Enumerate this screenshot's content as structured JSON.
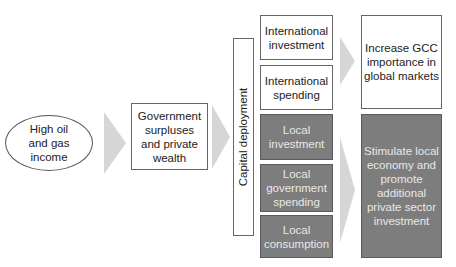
{
  "diagram": {
    "source": {
      "label": "High oil and gas income",
      "lines": [
        "High oil",
        "and gas",
        "income"
      ]
    },
    "intermediate": {
      "label": "Government surpluses and private wealth",
      "lines": [
        "Government",
        "surpluses",
        "and private",
        "wealth"
      ]
    },
    "deployment_bar": {
      "label": "Capital deployment"
    },
    "channels": [
      {
        "label": "International investment",
        "lines": [
          "International",
          "investment"
        ],
        "style": "white"
      },
      {
        "label": "International spending",
        "lines": [
          "International",
          "spending"
        ],
        "style": "white"
      },
      {
        "label": "Local investment",
        "lines": [
          "Local",
          "investment"
        ],
        "style": "dark"
      },
      {
        "label": "Local government spending",
        "lines": [
          "Local",
          "government",
          "spending"
        ],
        "style": "dark"
      },
      {
        "label": "Local consumption",
        "lines": [
          "Local",
          "consumption"
        ],
        "style": "dark"
      }
    ],
    "outcomes": [
      {
        "label": "Increase GCC importance in global markets",
        "lines": [
          "Increase GCC",
          "importance in",
          "global markets"
        ],
        "style": "white"
      },
      {
        "label": "Stimulate local economy and promote additional private sector investment",
        "lines": [
          "Stimulate local",
          "economy and",
          "promote",
          "additional",
          "private sector",
          "investment"
        ],
        "style": "dark"
      }
    ],
    "colors": {
      "dark_fill": "#7d7d7d",
      "arrow_fill": "#d6d6d6",
      "border": "#666666"
    }
  }
}
